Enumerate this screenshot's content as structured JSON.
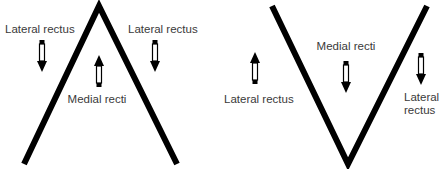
{
  "colors": {
    "line": "#000000",
    "text": "#3a3a3a",
    "arrow_fill": "#ffffff",
    "background": "#ffffff"
  },
  "figures": [
    {
      "name": "A-pattern",
      "shape": "inverted-V",
      "labels": {
        "left": "Lateral rectus",
        "right": "Lateral rectus",
        "center": "Medial recti"
      },
      "arrows": {
        "left": "down",
        "right": "down",
        "center": "up"
      }
    },
    {
      "name": "V-pattern",
      "shape": "V",
      "labels": {
        "left": "Lateral rectus",
        "center": "Medial recti",
        "right_line1": "Lateral",
        "right_line2": "rectus"
      },
      "arrows": {
        "left": "up",
        "center": "down",
        "right": "down"
      }
    }
  ]
}
